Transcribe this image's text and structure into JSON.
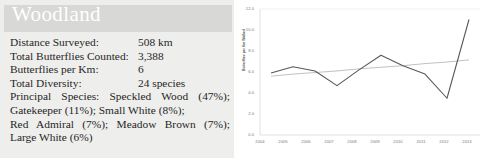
{
  "panel": {
    "title": "Woodland",
    "stats": [
      {
        "label": "Distance Surveyed:",
        "value": "508 km"
      },
      {
        "label": "Total Butterflies Counted:",
        "value": "3,388"
      },
      {
        "label": "Butterflies per Km:",
        "value": "6"
      },
      {
        "label": "Total Diversity:",
        "value": "24 species"
      }
    ],
    "species_lines": [
      "Principal Species: Speckled Wood (47%);",
      "Gatekeeper (11%); Small White (8%);",
      "Red Admiral (7%); Meadow Brown (7%);",
      "Large White (6%)"
    ]
  },
  "colors": {
    "panel_background": "#eeeeec",
    "title_band": "#d8d8d6",
    "title_text": "#ffffff",
    "body_text": "#262626",
    "chart_background": "#ffffff",
    "series_line": "#595959",
    "trend_line": "#a6a6a6",
    "axis_line": "#d9d9d9",
    "tick_text": "#7a7a7a"
  },
  "chart_data": {
    "type": "line",
    "title": "",
    "xlabel": "",
    "ylabel": "Butterflies per Km Walked",
    "x": [
      2004,
      2005,
      2006,
      2007,
      2008,
      2009,
      2010,
      2011,
      2012,
      2013
    ],
    "categories": [
      "2004",
      "2005",
      "2006",
      "2007",
      "2008",
      "2009",
      "2010",
      "2011",
      "2012",
      "2013"
    ],
    "ylim": [
      0.0,
      12.0
    ],
    "yticks": [
      "0.0",
      "2.0",
      "4.0",
      "6.0",
      "8.0",
      "10.0",
      "12.0"
    ],
    "ytick_values": [
      0.0,
      2.0,
      4.0,
      6.0,
      8.0,
      10.0,
      12.0
    ],
    "grid": false,
    "legend": "none",
    "series": [
      {
        "name": "Butterflies per Km Walked",
        "values": [
          5.9,
          6.5,
          6.1,
          4.7,
          6.2,
          7.6,
          6.6,
          5.8,
          3.5,
          11.0
        ]
      },
      {
        "name": "Linear trend",
        "values": [
          5.6,
          5.8,
          5.95,
          6.1,
          6.3,
          6.45,
          6.6,
          6.8,
          6.95,
          7.15
        ]
      }
    ]
  }
}
